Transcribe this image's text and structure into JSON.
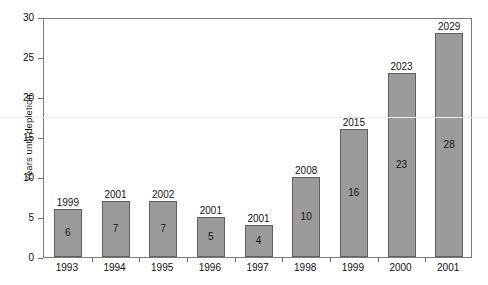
{
  "chart_data": {
    "type": "bar",
    "title": "",
    "xlabel": "",
    "ylabel": "Years until depletion",
    "ylim": [
      0,
      30
    ],
    "ytick_labels": [
      "0",
      "5",
      "10",
      "15",
      "20",
      "25",
      "30"
    ],
    "ytick_values": [
      0,
      5,
      10,
      15,
      20,
      25,
      30
    ],
    "grid": false,
    "legend": null,
    "categories": [
      "1993",
      "1994",
      "1995",
      "1996",
      "1997",
      "1998",
      "1999",
      "2000",
      "2001"
    ],
    "values": [
      6,
      7,
      7,
      5,
      4,
      10,
      16,
      23,
      28
    ],
    "value_labels": [
      "6",
      "7",
      "7",
      "5",
      "4",
      "10",
      "16",
      "23",
      "28"
    ],
    "top_labels": [
      "1999",
      "2001",
      "2002",
      "2001",
      "2001",
      "2008",
      "2015",
      "2023",
      "2029"
    ],
    "series": [
      {
        "name": "Years until depletion",
        "values": [
          6,
          7,
          7,
          5,
          4,
          10,
          16,
          23,
          28
        ]
      }
    ],
    "bar_color": "#9b9b9b",
    "bar_border_color": "#606060",
    "axis_color": "#7b7b7b",
    "text_color": "#151515",
    "background_color": "#ffffff"
  }
}
